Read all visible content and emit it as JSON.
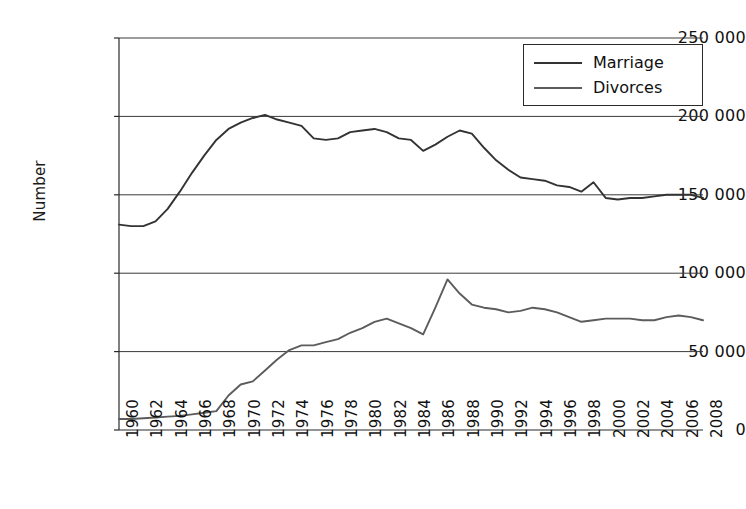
{
  "chart_data": {
    "type": "line",
    "title": "",
    "xlabel": "",
    "ylabel": "Number",
    "ylim": [
      0,
      250000
    ],
    "xlim": [
      1960,
      2008
    ],
    "y_ticks": [
      0,
      50000,
      100000,
      150000,
      200000,
      250000
    ],
    "y_tick_labels": [
      "0",
      "50 000",
      "100 000",
      "150 000",
      "200 000",
      "250 000"
    ],
    "x_ticks": [
      1960,
      1962,
      1964,
      1966,
      1968,
      1970,
      1972,
      1974,
      1976,
      1978,
      1980,
      1982,
      1984,
      1986,
      1988,
      1990,
      1992,
      1994,
      1996,
      1998,
      2000,
      2002,
      2004,
      2006,
      2008
    ],
    "x_tick_labels": [
      "1960",
      "1962",
      "1964",
      "1966",
      "1968",
      "1970",
      "1972",
      "1974",
      "1976",
      "1978",
      "1980",
      "1982",
      "1984",
      "1986",
      "1988",
      "1990",
      "1992",
      "1994",
      "1996",
      "1998",
      "2000",
      "2002",
      "2004",
      "2006",
      "2008"
    ],
    "grid": "horizontal",
    "legend_position": "top-right",
    "x": [
      1960,
      1961,
      1962,
      1963,
      1964,
      1965,
      1966,
      1967,
      1968,
      1969,
      1970,
      1971,
      1972,
      1973,
      1974,
      1975,
      1976,
      1977,
      1978,
      1979,
      1980,
      1981,
      1982,
      1983,
      1984,
      1985,
      1986,
      1987,
      1988,
      1989,
      1990,
      1991,
      1992,
      1993,
      1994,
      1995,
      1996,
      1997,
      1998,
      1999,
      2000,
      2001,
      2002,
      2003,
      2004,
      2005,
      2006,
      2007,
      2008
    ],
    "series": [
      {
        "name": "Marriage",
        "color": "#333333",
        "values": [
          131000,
          130000,
          130000,
          133000,
          141000,
          152000,
          164000,
          175000,
          185000,
          192000,
          196000,
          199000,
          201000,
          198000,
          196000,
          194000,
          186000,
          185000,
          186000,
          190000,
          191000,
          192000,
          190000,
          186000,
          185000,
          178000,
          182000,
          187000,
          191000,
          189000,
          180000,
          172000,
          166000,
          161000,
          160000,
          159000,
          156000,
          155000,
          152000,
          158000,
          148000,
          147000,
          148000,
          148000,
          149000,
          150000,
          150000,
          150000,
          148000
        ]
      },
      {
        "name": "Divorces",
        "color": "#5c5c5c",
        "values": [
          7000,
          7000,
          7500,
          8000,
          8500,
          9000,
          10000,
          11000,
          12000,
          22000,
          29000,
          31000,
          38000,
          45000,
          51000,
          54000,
          54000,
          56000,
          58000,
          62000,
          65000,
          69000,
          71000,
          68000,
          65000,
          61000,
          78000,
          96000,
          87000,
          80000,
          78000,
          77000,
          75000,
          76000,
          78000,
          77000,
          75000,
          72000,
          69000,
          70000,
          71000,
          71000,
          71000,
          70000,
          70000,
          72000,
          73000,
          72000,
          70000
        ]
      }
    ]
  },
  "legend": {
    "entries": [
      {
        "label": "Marriage"
      },
      {
        "label": "Divorces"
      }
    ]
  },
  "axes": {
    "y_title": "Number"
  }
}
